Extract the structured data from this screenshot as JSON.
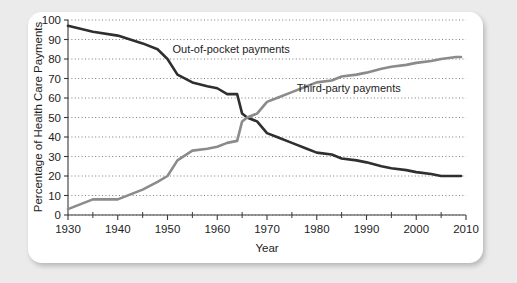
{
  "chart_data": {
    "type": "line",
    "title": "",
    "xlabel": "Year",
    "ylabel": "Percentage of Health Care Payments",
    "xlim": [
      1930,
      2010
    ],
    "ylim": [
      0,
      100
    ],
    "grid": true,
    "grid_style": "dotted-horizontal",
    "legend": "inline-annotations",
    "y_ticks": [
      0,
      10,
      20,
      30,
      40,
      50,
      60,
      70,
      80,
      90,
      100
    ],
    "y_ticklabels": [
      "0",
      "10",
      "20",
      "30",
      "40",
      "50",
      "60",
      "70",
      "80",
      "90",
      "100"
    ],
    "x_ticks": [
      1930,
      1940,
      1950,
      1960,
      1970,
      1980,
      1990,
      2000,
      2010
    ],
    "x_ticklabels": [
      "1930",
      "1940",
      "1950",
      "1960",
      "1970",
      "1980",
      "1990",
      "2000",
      "2010"
    ],
    "x_minor_ticks": [
      1935,
      1945,
      1955,
      1965,
      1975,
      1985,
      1995,
      2005
    ],
    "series": [
      {
        "name": "Out-of-pocket payments",
        "color": "#2f2f2f",
        "label_x": 1951,
        "label_y": 85,
        "x": [
          1930,
          1935,
          1940,
          1945,
          1948,
          1950,
          1952,
          1955,
          1958,
          1960,
          1962,
          1964,
          1965,
          1966,
          1968,
          1970,
          1972,
          1975,
          1978,
          1980,
          1983,
          1985,
          1988,
          1990,
          1993,
          1995,
          1998,
          2000,
          2003,
          2005,
          2008,
          2009
        ],
        "values": [
          97,
          94,
          92,
          88,
          85,
          80,
          72,
          68,
          66,
          65,
          62,
          62,
          52,
          50,
          48,
          42,
          40,
          37,
          34,
          32,
          31,
          29,
          28,
          27,
          25,
          24,
          23,
          22,
          21,
          20,
          20,
          20
        ]
      },
      {
        "name": "Third-party payments",
        "color": "#8b8b8b",
        "label_x": 1976,
        "label_y": 65,
        "x": [
          1930,
          1935,
          1940,
          1945,
          1948,
          1950,
          1952,
          1955,
          1958,
          1960,
          1962,
          1964,
          1965,
          1966,
          1968,
          1970,
          1972,
          1975,
          1978,
          1980,
          1983,
          1985,
          1988,
          1990,
          1993,
          1995,
          1998,
          2000,
          2003,
          2005,
          2008,
          2009
        ],
        "values": [
          3,
          8,
          8,
          13,
          17,
          20,
          28,
          33,
          34,
          35,
          37,
          38,
          48,
          50,
          52,
          58,
          60,
          63,
          66,
          68,
          69,
          71,
          72,
          73,
          75,
          76,
          77,
          78,
          79,
          80,
          81,
          81
        ]
      }
    ]
  },
  "axis": {
    "y_label": "Percentage of Health Care Payments",
    "x_label": "Year"
  },
  "annotations": {
    "out_of_pocket": "Out-of-pocket payments",
    "third_party": "Third-party payments"
  },
  "y_ticklabels": [
    "100",
    "90",
    "80",
    "70",
    "60",
    "50",
    "40",
    "30",
    "20",
    "10",
    "0"
  ],
  "x_ticklabels": [
    "1930",
    "1940",
    "1950",
    "1960",
    "1970",
    "1980",
    "1990",
    "2000",
    "2010"
  ]
}
